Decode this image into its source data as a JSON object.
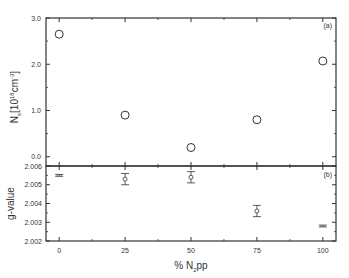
{
  "chart_data": [
    {
      "type": "scatter",
      "panel_label": "(a)",
      "title": "",
      "xlabel": "",
      "ylabel_main": "N",
      "ylabel_sub": "s",
      "ylabel_unit": "[10",
      "ylabel_exp": "18",
      "ylabel_unit2": "cm",
      "ylabel_exp2": "-3",
      "ylabel_close": "]",
      "xlim": [
        -5,
        105
      ],
      "ylim": [
        -0.2,
        3.0
      ],
      "yticks": [
        0.0,
        1.0,
        2.0,
        3.0
      ],
      "ytick_labels": [
        "0.0",
        "1.0",
        "2.0",
        "3.0"
      ],
      "marker": "open-circle",
      "x": [
        0,
        25,
        50,
        75,
        100
      ],
      "y": [
        2.65,
        0.9,
        0.2,
        0.8,
        2.07
      ]
    },
    {
      "type": "scatter",
      "panel_label": "(b)",
      "title": "",
      "xlabel_prefix": "% N",
      "xlabel_sub": "2",
      "xlabel_suffix": "pp",
      "ylabel": "g-value",
      "xlim": [
        -5,
        105
      ],
      "ylim": [
        2.002,
        2.006
      ],
      "xticks": [
        0,
        25,
        50,
        75,
        100
      ],
      "xtick_labels": [
        "0",
        "25",
        "50",
        "75",
        "100"
      ],
      "yticks": [
        2.002,
        2.003,
        2.004,
        2.005,
        2.006
      ],
      "ytick_labels": [
        "2.002",
        "2.003",
        "2.004",
        "2.005",
        "2.006"
      ],
      "marker": "open-diamond-with-errorbars",
      "x": [
        0,
        25,
        50,
        75,
        100
      ],
      "y": [
        2.0055,
        2.0053,
        2.0054,
        2.0036,
        2.0028
      ],
      "yerr": [
        5e-05,
        0.0003,
        0.0003,
        0.0003,
        5e-05
      ]
    }
  ]
}
